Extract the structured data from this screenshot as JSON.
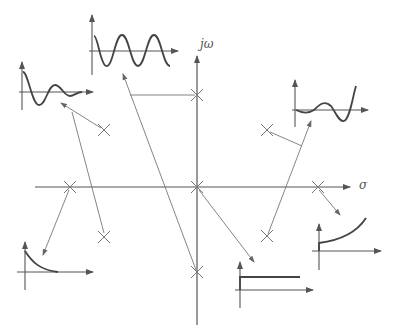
{
  "diagram": {
    "title": "",
    "axes": {
      "imag_label": "jω",
      "real_label": "σ"
    },
    "poles": [
      {
        "id": "jw-upper",
        "location": "imaginary axis, upper",
        "response": "sustained oscillation"
      },
      {
        "id": "origin",
        "location": "origin",
        "response": "step (constant)"
      },
      {
        "id": "jw-lower",
        "location": "imaginary axis, lower",
        "response": "sustained oscillation"
      },
      {
        "id": "neg-real",
        "location": "negative real axis",
        "response": "decaying exponential"
      },
      {
        "id": "pos-real",
        "location": "positive real axis",
        "response": "growing exponential"
      },
      {
        "id": "lhp-upper",
        "location": "left half-plane, upper",
        "response": "damped oscillation"
      },
      {
        "id": "lhp-lower",
        "location": "left half-plane, lower",
        "response": "damped oscillation"
      },
      {
        "id": "rhp-upper",
        "location": "right half-plane, upper",
        "response": "growing oscillation"
      },
      {
        "id": "rhp-lower",
        "location": "right half-plane, lower",
        "response": "growing oscillation"
      }
    ],
    "responses": [
      {
        "id": "sustained-oscillation",
        "description": "constant-amplitude sinusoid"
      },
      {
        "id": "damped-oscillation",
        "description": "decaying sinusoid"
      },
      {
        "id": "growing-oscillation",
        "description": "growing sinusoid"
      },
      {
        "id": "decaying-exponential",
        "description": "exponential decay"
      },
      {
        "id": "growing-exponential",
        "description": "exponential growth"
      },
      {
        "id": "step",
        "description": "constant step"
      }
    ],
    "colors": {
      "line": "#666666",
      "curve": "#555555",
      "background": "#ffffff"
    }
  }
}
